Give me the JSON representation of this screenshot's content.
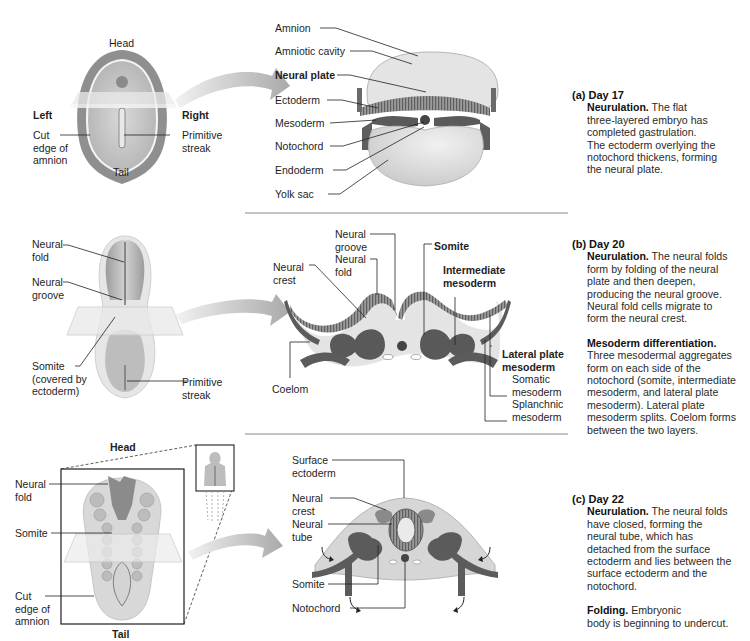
{
  "figure": {
    "colors": {
      "ectoderm": "#7a7a7a",
      "mesoderm": "#555555",
      "yolk": "#dcdcdc",
      "amnion": "#e2e2e2",
      "divider": "#8a8a8a",
      "arrow": "#c4c4c4"
    }
  },
  "panels": [
    {
      "id": "a",
      "stage_label": "(a) Day 17",
      "left_view_labels": {
        "head": "Head",
        "tail": "Tail",
        "left": "Left",
        "right": "Right",
        "cut_edge": [
          "Cut",
          "edge of",
          "amnion"
        ],
        "primitive_streak": [
          "Primitive",
          "streak"
        ]
      },
      "section_labels": [
        "Amnion",
        "Amniotic cavity",
        "Neural plate",
        "Ectoderm",
        "Mesoderm",
        "Notochord",
        "Endoderm",
        "Yolk sac"
      ],
      "description": [
        {
          "keyword": "Neurulation.",
          "lines": [
            "The flat",
            "three-layered embryo has",
            "completed gastrulation.",
            "The ectoderm overlying the",
            "notochord thickens, forming",
            "the neural plate."
          ]
        }
      ]
    },
    {
      "id": "b",
      "stage_label": "(b) Day 20",
      "left_view_labels": {
        "neural_fold": [
          "Neural",
          "fold"
        ],
        "neural_groove": [
          "Neural",
          "groove"
        ],
        "somite": [
          "Somite",
          "(covered by",
          "ectoderm)"
        ],
        "primitive_streak": [
          "Primitive",
          "streak"
        ]
      },
      "section_labels": {
        "neural_crest": [
          "Neural",
          "crest"
        ],
        "neural_groove": [
          "Neural",
          "groove"
        ],
        "neural_fold": [
          "Neural",
          "fold"
        ],
        "somite": "Somite",
        "intermediate_mesoderm": [
          "Intermediate",
          "mesoderm"
        ],
        "lateral_plate_mesoderm": [
          "Lateral plate",
          "mesoderm"
        ],
        "somatic_mesoderm": [
          "Somatic",
          "mesoderm"
        ],
        "splanchnic_mesoderm": [
          "Splanchnic",
          "mesoderm"
        ],
        "coelom": "Coelom"
      },
      "description": [
        {
          "keyword": "Neurulation.",
          "lines": [
            "The neural folds",
            "form by folding of the neural",
            "plate and then deepen,",
            "producing the neural groove.",
            "Neural fold cells migrate to",
            "form the neural crest."
          ]
        },
        {
          "keyword": "Mesoderm differentiation.",
          "lines": [
            "Three mesodermal aggregates",
            "form on each side of the",
            "notochord (somite, intermediate",
            "mesoderm, and lateral plate",
            "mesoderm). Lateral plate",
            "mesoderm splits. Coelom forms",
            "between the two layers."
          ]
        }
      ]
    },
    {
      "id": "c",
      "stage_label": "(c) Day 22",
      "left_view_labels": {
        "head": "Head",
        "tail": "Tail",
        "neural_fold": [
          "Neural",
          "fold"
        ],
        "somite": "Somite",
        "cut_edge": [
          "Cut",
          "edge of",
          "amnion"
        ]
      },
      "section_labels": {
        "surface_ectoderm": [
          "Surface",
          "ectoderm"
        ],
        "neural_crest": [
          "Neural",
          "crest"
        ],
        "neural_tube": [
          "Neural",
          "tube"
        ],
        "somite": "Somite",
        "notochord": "Notochord"
      },
      "description": [
        {
          "keyword": "Neurulation.",
          "lines": [
            "The neural folds",
            "have closed, forming the",
            "neural tube, which has",
            "detached from the surface",
            "ectoderm and lies between the",
            "surface ectoderm and the",
            "notochord."
          ]
        },
        {
          "keyword": "Folding.",
          "lines": [
            "Embryonic",
            "body is beginning to undercut."
          ]
        }
      ]
    }
  ]
}
